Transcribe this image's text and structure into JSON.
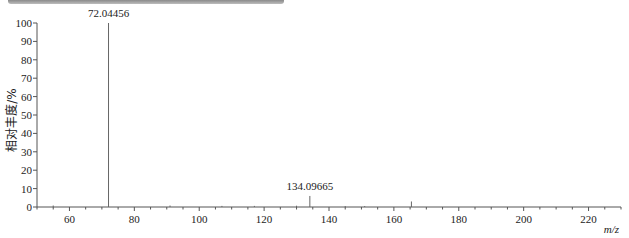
{
  "chart_data": {
    "type": "bar",
    "subtype": "mass-spectrum-stick",
    "title": "",
    "xlabel": "m/z",
    "ylabel": "相对丰度/%",
    "xlim": [
      50,
      230
    ],
    "ylim": [
      0,
      100
    ],
    "x_ticks": [
      60,
      80,
      100,
      120,
      140,
      160,
      180,
      200,
      220
    ],
    "y_ticks": [
      0,
      10,
      20,
      30,
      40,
      50,
      60,
      70,
      80,
      90,
      100
    ],
    "grid": false,
    "legend": null,
    "peaks": [
      {
        "mz": 72.04456,
        "intensity": 100,
        "label": "72.04456"
      },
      {
        "mz": 134.09665,
        "intensity": 6,
        "label": "134.09665"
      },
      {
        "mz": 165.4,
        "intensity": 3,
        "label": ""
      },
      {
        "mz": 55.0,
        "intensity": 0.8,
        "label": ""
      },
      {
        "mz": 91.0,
        "intensity": 0.8,
        "label": ""
      },
      {
        "mz": 107.0,
        "intensity": 0.6,
        "label": ""
      },
      {
        "mz": 117.0,
        "intensity": 0.6,
        "label": ""
      },
      {
        "mz": 130.0,
        "intensity": 0.7,
        "label": ""
      },
      {
        "mz": 145.0,
        "intensity": 0.5,
        "label": ""
      },
      {
        "mz": 151.0,
        "intensity": 0.5,
        "label": ""
      }
    ]
  },
  "labels": {
    "ylabel": "相对丰度/%",
    "xlabel": "m/z",
    "peak_main": "72.04456",
    "peak_second": "134.09665"
  }
}
